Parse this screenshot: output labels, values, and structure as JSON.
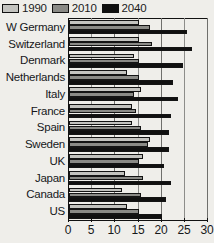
{
  "chart_data": {
    "type": "bar",
    "orientation": "horizontal",
    "title": "",
    "xlabel": "",
    "ylabel": "",
    "xlim": [
      0,
      30
    ],
    "xticks": [
      0,
      5,
      10,
      15,
      20,
      25,
      30
    ],
    "grid": true,
    "legend_position": "top-left",
    "categories": [
      "W Germany",
      "Switzerland",
      "Denmark",
      "Netherlands",
      "Italy",
      "France",
      "Spain",
      "Sweden",
      "UK",
      "Japan",
      "Canada",
      "US"
    ],
    "series": [
      {
        "name": "1990",
        "color": "#c3c3bf",
        "values": [
          15,
          15,
          14,
          12.5,
          15.5,
          13.5,
          13.5,
          17.5,
          16,
          12,
          11.5,
          12.5
        ]
      },
      {
        "name": "2010",
        "color": "#8a8a86",
        "values": [
          17.5,
          18,
          15,
          15,
          14,
          14.5,
          15.5,
          17,
          15,
          16,
          15.5,
          15
        ]
      },
      {
        "name": "2040",
        "color": "#101010",
        "values": [
          25.5,
          26.5,
          24.5,
          22.5,
          23.5,
          22,
          21.5,
          21.5,
          20.5,
          22,
          21,
          20
        ]
      }
    ]
  },
  "legend": {
    "items": [
      {
        "label": "1990",
        "color": "#c3c3bf"
      },
      {
        "label": "2010",
        "color": "#8a8a86"
      },
      {
        "label": "2040",
        "color": "#101010"
      }
    ]
  },
  "axis": {
    "tick_labels": [
      "0",
      "5",
      "10",
      "15",
      "20",
      "25",
      "30"
    ]
  }
}
